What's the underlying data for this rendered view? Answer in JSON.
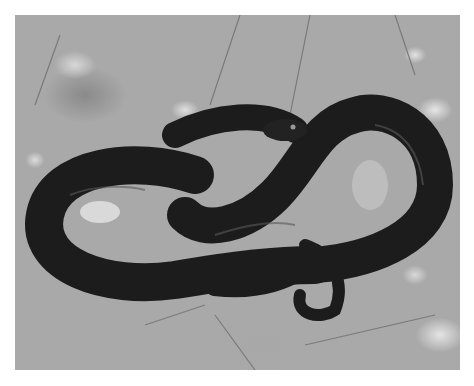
{
  "image": {
    "subject": "coiled black snake on gravel ground",
    "style": "black-and-white photograph",
    "colors": {
      "background": "#ffffff",
      "ground": "#a9a9a9",
      "snake": "#1e1e1e",
      "highlight": "#6a6a6a"
    }
  }
}
